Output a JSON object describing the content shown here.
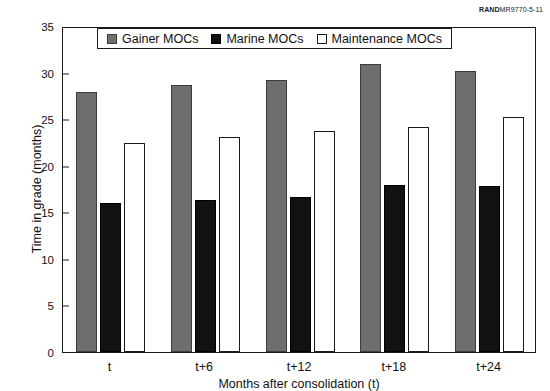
{
  "credit": {
    "brand": "RAND",
    "code": "MR9770-5-11"
  },
  "chart_data": {
    "type": "bar",
    "title": "",
    "xlabel": "Months after consolidation (t)",
    "ylabel": "Time in grade (months)",
    "categories": [
      "t",
      "t+6",
      "t+12",
      "t+18",
      "t+24"
    ],
    "ylim": [
      0,
      35
    ],
    "yticks": [
      "0",
      "5",
      "10",
      "15",
      "20",
      "25",
      "30",
      "35"
    ],
    "grid": false,
    "legend_position": "top-center",
    "series": [
      {
        "name": "Gainer MOCs",
        "color": "#6e6e6e",
        "values": [
          27.9,
          28.7,
          29.2,
          30.9,
          30.2
        ]
      },
      {
        "name": "Marine MOCs",
        "color": "#111111",
        "values": [
          16.0,
          16.3,
          16.6,
          17.9,
          17.8
        ]
      },
      {
        "name": "Maintenance MOCs",
        "color": "#ffffff",
        "values": [
          22.4,
          23.1,
          23.7,
          24.2,
          25.2
        ]
      }
    ]
  }
}
